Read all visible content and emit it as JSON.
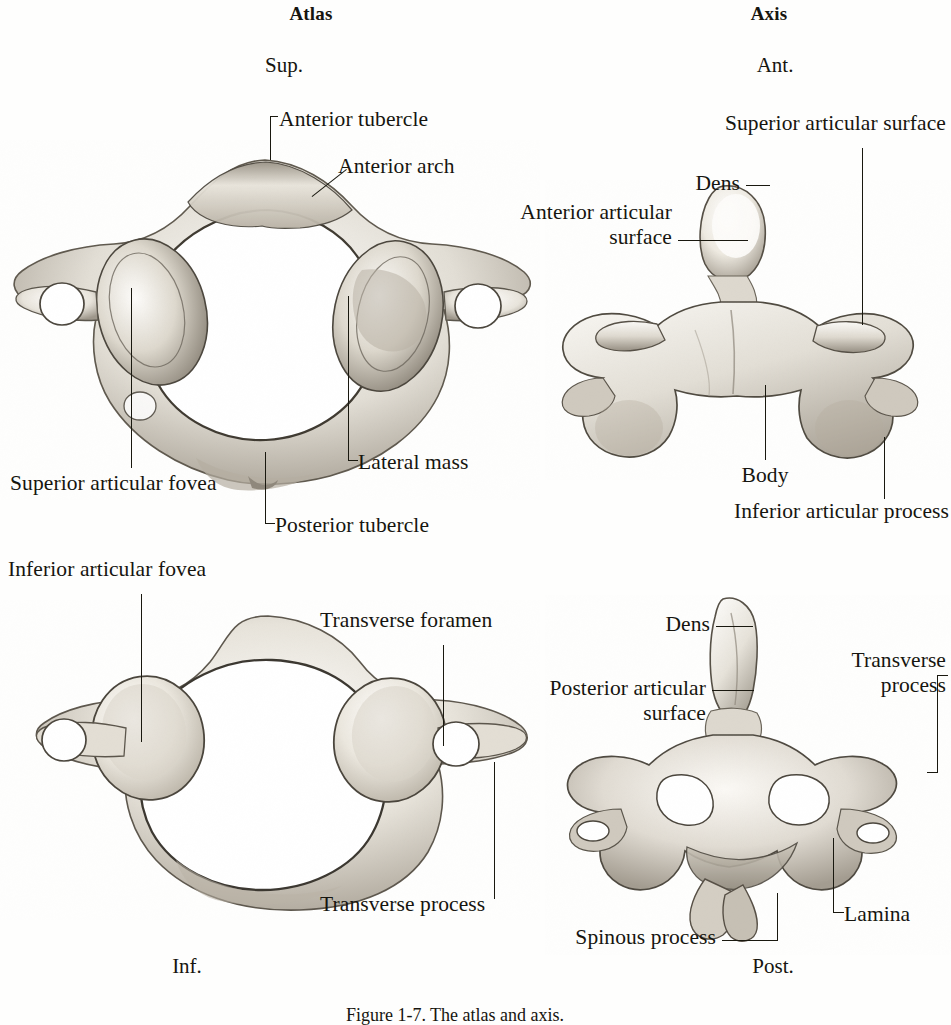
{
  "plate": {
    "caption": "Figure 1-7. The atlas and axis."
  },
  "columns": [
    {
      "title": "Atlas",
      "orientation_top": "Sup.",
      "orientation_bottom": "Inf."
    },
    {
      "title": "Axis",
      "orientation_top": "Ant.",
      "orientation_bottom": "Post."
    }
  ],
  "figures": [
    {
      "id": "atlas-superior",
      "bone": "Atlas",
      "view": "Superior",
      "labels": [
        "Anterior tubercle",
        "Anterior arch",
        "Lateral mass",
        "Superior articular fovea",
        "Posterior tubercle"
      ]
    },
    {
      "id": "axis-anterior",
      "bone": "Axis",
      "view": "Anterior",
      "labels": [
        "Superior articular surface",
        "Dens",
        "Anterior articular",
        "surface",
        "Body",
        "Inferior articular process"
      ]
    },
    {
      "id": "atlas-inferior",
      "bone": "Atlas",
      "view": "Inferior",
      "labels": [
        "Inferior articular fovea",
        "Transverse foramen",
        "Transverse process"
      ]
    },
    {
      "id": "axis-posterior",
      "bone": "Axis",
      "view": "Posterior",
      "labels": [
        "Dens",
        "Posterior articular",
        "surface",
        "Transverse",
        "process",
        "Lamina",
        "Spinous process"
      ]
    }
  ],
  "atlas_superior": {
    "anterior_tubercle": "Anterior tubercle",
    "anterior_arch": "Anterior arch",
    "lateral_mass": "Lateral mass",
    "superior_articular_fovea": "Superior articular fovea",
    "posterior_tubercle": "Posterior tubercle"
  },
  "axis_anterior": {
    "superior_articular_surface": "Superior articular surface",
    "dens": "Dens",
    "anterior_articular_l1": "Anterior articular",
    "anterior_articular_l2": "surface",
    "body": "Body",
    "inferior_articular_process": "Inferior articular process"
  },
  "atlas_inferior": {
    "inferior_articular_fovea": "Inferior articular fovea",
    "transverse_foramen": "Transverse foramen",
    "transverse_process": "Transverse process"
  },
  "axis_posterior": {
    "dens": "Dens",
    "posterior_articular_l1": "Posterior articular",
    "posterior_articular_l2": "surface",
    "transverse_process_l1": "Transverse",
    "transverse_process_l2": "process",
    "lamina": "Lamina",
    "spinous_process": "Spinous process"
  },
  "colors": {
    "ink": "#16150f",
    "leader": "#19180f",
    "paper": "#fefefd",
    "bone_light": "#f4f2ed",
    "bone_mid": "#c9c4ba",
    "bone_dark": "#8d877c"
  }
}
